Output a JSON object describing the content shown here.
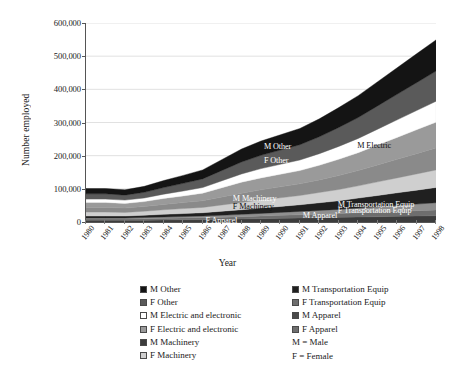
{
  "chart_data": {
    "type": "area",
    "stacked": true,
    "title": "",
    "xlabel": "Year",
    "ylabel": "Number employed",
    "ylim": [
      0,
      600000
    ],
    "ytick_labels": [
      "0",
      "100,000",
      "200,000",
      "300,000",
      "400,000",
      "500,000",
      "600,000"
    ],
    "ytick_values": [
      0,
      100000,
      200000,
      300000,
      400000,
      500000,
      600000
    ],
    "grid": true,
    "legend_position": "bottom",
    "categories": [
      1980,
      1981,
      1982,
      1983,
      1984,
      1985,
      1986,
      1987,
      1988,
      1989,
      1990,
      1991,
      1992,
      1993,
      1994,
      1995,
      1996,
      1997,
      1998
    ],
    "xtick_labels": [
      "1980",
      "1981",
      "1982",
      "1983",
      "1984",
      "1985",
      "1986",
      "1987",
      "1988",
      "1989",
      "1990",
      "1991",
      "1992",
      "1993",
      "1994",
      "1995",
      "1996",
      "1997",
      "1998"
    ],
    "stack_order_bottom_to_top": [
      "F Apparel",
      "M Apparel",
      "F Transportation Equip",
      "M Transportation Equip",
      "F Machinery",
      "M Machinery",
      "F Electric and electronic",
      "M Electric and electronic",
      "F Other",
      "M Other"
    ],
    "series": [
      {
        "name": "F Apparel",
        "color": "#3c3c3c",
        "values": [
          5000,
          5000,
          5000,
          5500,
          6000,
          6500,
          7000,
          8000,
          9000,
          10000,
          11000,
          12000,
          13000,
          14000,
          15000,
          16000,
          17000,
          18000,
          19000
        ]
      },
      {
        "name": "M Apparel",
        "color": "#6e6e6e",
        "values": [
          4000,
          4000,
          4000,
          4500,
          5000,
          5500,
          6000,
          6500,
          7000,
          8000,
          9000,
          10000,
          11000,
          12000,
          13000,
          14000,
          15000,
          16000,
          17000
        ]
      },
      {
        "name": "F Transportation Equip",
        "color": "#8f8f8f",
        "values": [
          3000,
          3000,
          3000,
          3500,
          4000,
          4500,
          5000,
          6000,
          7000,
          8000,
          9000,
          10000,
          11000,
          12000,
          14000,
          16000,
          18000,
          20000,
          22000
        ]
      },
      {
        "name": "M Transportation Equip",
        "color": "#202020",
        "values": [
          6000,
          6000,
          6000,
          7000,
          8000,
          9000,
          10000,
          12000,
          14000,
          16000,
          18000,
          20000,
          23000,
          26000,
          30000,
          34000,
          38000,
          42000,
          46000
        ]
      },
      {
        "name": "F Machinery",
        "color": "#cfcfcf",
        "values": [
          12000,
          12000,
          11000,
          12000,
          14000,
          15000,
          16000,
          19000,
          22000,
          24000,
          26000,
          28000,
          31000,
          34000,
          37000,
          41000,
          45000,
          49000,
          53000
        ]
      },
      {
        "name": "M Machinery",
        "color": "#8a8a8a",
        "values": [
          14000,
          14000,
          13000,
          14000,
          16000,
          18000,
          20000,
          24000,
          28000,
          31000,
          33000,
          35000,
          38000,
          42000,
          46000,
          51000,
          56000,
          61000,
          66000
        ]
      },
      {
        "name": "F Electric and electronic",
        "color": "#9a9a9a",
        "values": [
          15000,
          15000,
          14000,
          15000,
          18000,
          20000,
          23000,
          28000,
          33000,
          36000,
          38000,
          40000,
          44000,
          49000,
          54000,
          60000,
          66000,
          72000,
          78000
        ]
      },
      {
        "name": "M Electric and electronic",
        "color": "#ffffff",
        "values": [
          10000,
          10000,
          10000,
          11000,
          13000,
          15000,
          17000,
          21000,
          25000,
          28000,
          30000,
          32000,
          35000,
          39000,
          43000,
          48000,
          53000,
          58000,
          63000
        ]
      },
      {
        "name": "F Other",
        "color": "#5a5a5a",
        "values": [
          16000,
          16000,
          15000,
          17000,
          20000,
          23000,
          26000,
          31000,
          36000,
          40000,
          43000,
          46000,
          51000,
          57000,
          63000,
          70000,
          77000,
          84000,
          91000
        ]
      },
      {
        "name": "M Other",
        "color": "#141414",
        "values": [
          16000,
          16000,
          16000,
          18000,
          21000,
          24000,
          27000,
          33000,
          39000,
          43000,
          46000,
          49000,
          54000,
          60000,
          66000,
          73000,
          80000,
          87000,
          94000
        ]
      }
    ],
    "totals": [
      101000,
      101000,
      97000,
      107500,
      125000,
      140500,
      157000,
      188500,
      220000,
      244000,
      263000,
      282000,
      311000,
      345000,
      381000,
      423000,
      465000,
      507000,
      549000
    ],
    "annotations": [
      {
        "text": "M Other",
        "series": "M Other"
      },
      {
        "text": "F Other",
        "series": "F Other"
      },
      {
        "text": "M Electric",
        "series": "M Electric and electronic"
      },
      {
        "text": "M Machinery",
        "series": "M Machinery"
      },
      {
        "text": "F Machinery",
        "series": "F Machinery"
      },
      {
        "text": "M Transportation Equip",
        "series": "M Transportation Equip"
      },
      {
        "text": "F Transportation Equip",
        "series": "F Transportation Equip"
      },
      {
        "text": "M Apparel",
        "series": "M Apparel"
      },
      {
        "text": "F Apparel",
        "series": "F Apparel"
      }
    ]
  },
  "axes": {
    "ylabel": "Number employed",
    "xlabel": "Year"
  },
  "legend": {
    "left_column": [
      {
        "label": "M Other",
        "color": "#141414"
      },
      {
        "label": "F Other",
        "color": "#5a5a5a"
      },
      {
        "label": "M Electric and electronic",
        "color": "#ffffff"
      },
      {
        "label": "F Electric and electronic",
        "color": "#9a9a9a"
      },
      {
        "label": "M Machinery",
        "color": "#3c3c3c"
      },
      {
        "label": "F Machinery",
        "color": "#cfcfcf"
      }
    ],
    "right_column": [
      {
        "label": "M Transportation Equip",
        "color": "#202020"
      },
      {
        "label": "F Transportation Equip",
        "color": "#6e6e6e"
      },
      {
        "label": "M Apparel",
        "color": "#4a4a4a"
      },
      {
        "label": "F Apparel",
        "color": "#6e6e6e"
      }
    ],
    "notes": [
      "M = Male",
      "F = Female"
    ]
  }
}
